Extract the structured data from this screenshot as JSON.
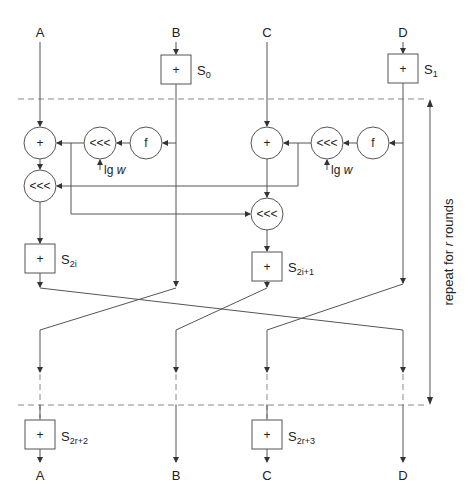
{
  "diagram": {
    "type": "cipher-round-flowchart",
    "inputs": [
      "A",
      "B",
      "C",
      "D"
    ],
    "outputs": [
      "A",
      "B",
      "C",
      "D"
    ],
    "pre_whitening": [
      {
        "op": "+",
        "key": "S",
        "key_sub": "0",
        "word": "B"
      },
      {
        "op": "+",
        "key": "S",
        "key_sub": "1",
        "word": "D"
      }
    ],
    "round_ops": {
      "add": "+",
      "rotate": "<<<",
      "func": "f",
      "rotate_amount": "lg",
      "rotate_amount_var": "w"
    },
    "round_keys": [
      {
        "key": "S",
        "key_sub": "2i"
      },
      {
        "key": "S",
        "key_sub": "2i+1"
      }
    ],
    "post_whitening": [
      {
        "op": "+",
        "key": "S",
        "key_sub": "2r+2",
        "word": "A"
      },
      {
        "op": "+",
        "key": "S",
        "key_sub": "2r+3",
        "word": "C"
      }
    ],
    "repeat_label": {
      "prefix": "repeat for ",
      "var": "r",
      "suffix": " rounds"
    }
  }
}
